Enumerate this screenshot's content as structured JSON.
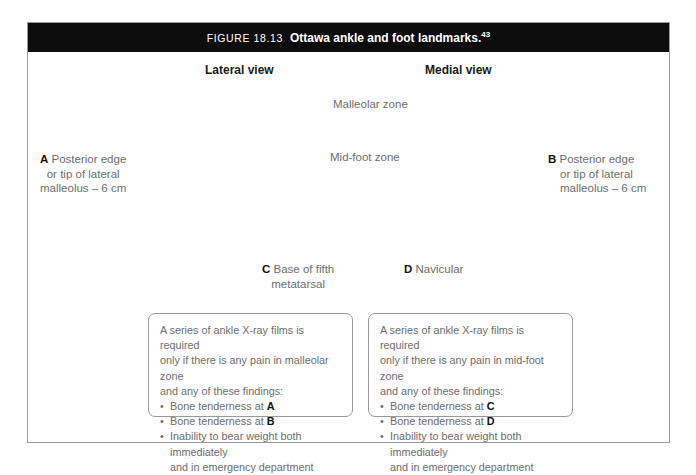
{
  "figure": {
    "number": "FIGURE 18.13",
    "title": "Ottawa ankle and foot landmarks.",
    "reference": "43"
  },
  "views": {
    "lateral": "Lateral view",
    "medial": "Medial view"
  },
  "zones": {
    "malleolar": "Malleolar zone",
    "midfoot": "Mid-foot zone"
  },
  "landmarks": {
    "a": {
      "letter": "A",
      "line1": "Posterior edge",
      "line2": "or tip of lateral",
      "line3": "malleolus – 6 cm"
    },
    "b": {
      "letter": "B",
      "line1": "Posterior edge",
      "line2": "or tip of lateral",
      "line3": "malleolus – 6 cm"
    },
    "c": {
      "letter": "C",
      "line1": "Base of fifth",
      "line2": "metatarsal"
    },
    "d": {
      "letter": "D",
      "line1": "Navicular"
    }
  },
  "criteria": {
    "malleolar": {
      "intro_line1": "A series of ankle X-ray films is required",
      "intro_line2": "only if there is any pain in malleolar zone",
      "intro_line3": "and any of these findings:",
      "item1_text": "Bone tenderness at ",
      "item1_letter": "A",
      "item2_text": "Bone tenderness at ",
      "item2_letter": "B",
      "item3_text": "Inability to bear weight both immediately",
      "item3_cont": "and in emergency department"
    },
    "midfoot": {
      "intro_line1": "A series of ankle X-ray films is required",
      "intro_line2": "only if there is any pain in mid-foot zone",
      "intro_line3": "and any of these findings:",
      "item1_text": "Bone tenderness at ",
      "item1_letter": "C",
      "item2_text": "Bone tenderness at ",
      "item2_letter": "D",
      "item3_text": "Inability to bear weight both immediately",
      "item3_cont": "and in emergency department"
    }
  },
  "colors": {
    "header_bar": "#0d0d0d",
    "frame_border": "#9a9a9a",
    "body_text": "#6e6e6e",
    "emphasis_text": "#111111",
    "shade_dark": "#8a8a8a",
    "shade_mid": "#a6a6a6",
    "shade_light": "#d8d8d8",
    "shade_pale": "#ededed",
    "outline": "#555555"
  },
  "artwork": {
    "lateral_label": "lateral-ankle-illustration",
    "medial_label": "medial-ankle-illustration"
  }
}
